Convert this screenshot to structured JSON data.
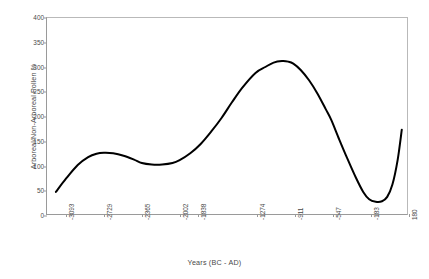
{
  "chart_data": {
    "type": "line",
    "title": "",
    "xlabel": "Years (BC - AD)",
    "ylabel": "Arboreal/Non-Arboreal Pollen %",
    "grid": false,
    "legend": "none",
    "xlim": [
      -3275,
      180
    ],
    "ylim": [
      0,
      400
    ],
    "xticklabels": [
      "-3093",
      "-2729",
      "-2365",
      "-2002",
      "-1838",
      "-1274",
      "-911",
      "-547",
      "-183",
      "180"
    ],
    "xtickvalues": [
      -3093,
      -2729,
      -2365,
      -2002,
      -1838,
      -1274,
      -911,
      -547,
      -183,
      180
    ],
    "yticklabels": [
      "0",
      "50",
      "100",
      "150",
      "200",
      "250",
      "300",
      "350",
      "400"
    ],
    "ytickvalues": [
      0,
      50,
      100,
      150,
      200,
      250,
      300,
      350,
      400
    ],
    "series": [
      {
        "name": "Arboreal/Non-Arboreal Pollen %",
        "color": "#000000",
        "linewidth": 2,
        "x": [
          -3190,
          -3093,
          -2980,
          -2880,
          -2800,
          -2729,
          -2640,
          -2540,
          -2440,
          -2365,
          -2270,
          -2170,
          -2070,
          -2002,
          -1900,
          -1800,
          -1700,
          -1600,
          -1500,
          -1400,
          -1274,
          -1180,
          -1100,
          -1020,
          -960,
          -911,
          -840,
          -760,
          -680,
          -600,
          -547,
          -470,
          -390,
          -310,
          -240,
          -183,
          -120,
          -60,
          -10,
          40,
          90,
          130
        ],
        "y": [
          45,
          72,
          100,
          116,
          123,
          125,
          124,
          119,
          111,
          104,
          101,
          101,
          104,
          110,
          124,
          143,
          168,
          196,
          228,
          258,
          288,
          300,
          309,
          312,
          311,
          307,
          294,
          273,
          246,
          214,
          192,
          152,
          112,
          74,
          45,
          30,
          25,
          26,
          35,
          60,
          110,
          172
        ]
      }
    ]
  }
}
